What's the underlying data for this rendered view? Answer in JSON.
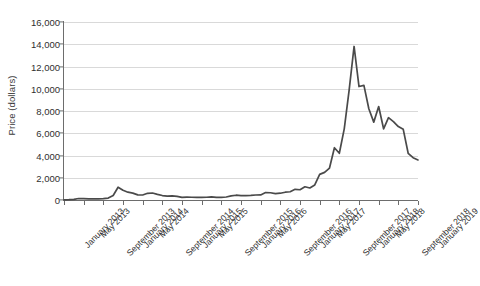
{
  "chart_data": {
    "type": "line",
    "title": "",
    "xlabel": "",
    "ylabel": "Price (dollars)",
    "ylim": [
      0,
      16000
    ],
    "ytick_values": [
      0,
      2000,
      4000,
      6000,
      8000,
      10000,
      12000,
      14000,
      16000
    ],
    "ytick_labels": [
      "0",
      "2,000",
      "4,000",
      "6,000",
      "8,000",
      "10,000",
      "12,000",
      "14,000",
      "16,000"
    ],
    "grid": true,
    "legend": null,
    "line_color": "#4a4a4a",
    "grid_color": "#d9d9d9",
    "axis_color": "#6d6d6d",
    "background_color": "#ffffff",
    "xtick_labels": [
      "January 2013",
      "May 2013",
      "September 2013",
      "January 2014",
      "May 2014",
      "September 2014",
      "January 2015",
      "May 2015",
      "September 2015",
      "January 2016",
      "May 2016",
      "September 2016",
      "January 2017",
      "May 2017",
      "September 2017",
      "January 2018",
      "May 2018",
      "September 2018",
      "January 2019"
    ],
    "x": [
      "January 2013",
      "February 2013",
      "March 2013",
      "April 2013",
      "May 2013",
      "June 2013",
      "July 2013",
      "August 2013",
      "September 2013",
      "October 2013",
      "November 2013",
      "December 2013",
      "January 2014",
      "February 2014",
      "March 2014",
      "April 2014",
      "May 2014",
      "June 2014",
      "July 2014",
      "August 2014",
      "September 2014",
      "October 2014",
      "November 2014",
      "December 2014",
      "January 2015",
      "February 2015",
      "March 2015",
      "April 2015",
      "May 2015",
      "June 2015",
      "July 2015",
      "August 2015",
      "September 2015",
      "October 2015",
      "November 2015",
      "December 2015",
      "January 2016",
      "February 2016",
      "March 2016",
      "April 2016",
      "May 2016",
      "June 2016",
      "July 2016",
      "August 2016",
      "September 2016",
      "October 2016",
      "November 2016",
      "December 2016",
      "January 2017",
      "February 2017",
      "March 2017",
      "April 2017",
      "May 2017",
      "June 2017",
      "July 2017",
      "August 2017",
      "September 2017",
      "October 2017",
      "November 2017",
      "December 2017",
      "January 2018",
      "February 2018",
      "March 2018",
      "April 2018",
      "May 2018",
      "June 2018",
      "July 2018",
      "August 2018",
      "September 2018",
      "October 2018",
      "November 2018",
      "December 2018",
      "January 2019"
    ],
    "values": [
      20,
      30,
      60,
      135,
      120,
      105,
      95,
      110,
      130,
      175,
      400,
      1150,
      870,
      700,
      620,
      460,
      450,
      600,
      630,
      510,
      400,
      350,
      375,
      320,
      230,
      250,
      245,
      230,
      235,
      245,
      285,
      230,
      235,
      270,
      375,
      430,
      400,
      400,
      420,
      450,
      455,
      665,
      650,
      570,
      610,
      700,
      740,
      960,
      920,
      1190,
      1080,
      1350,
      2300,
      2480,
      2870,
      4700,
      4200,
      6400,
      9900,
      13800,
      10200,
      10300,
      8200,
      7000,
      8400,
      6400,
      7400,
      7050,
      6600,
      6350,
      4200,
      3800,
      3600
    ]
  }
}
